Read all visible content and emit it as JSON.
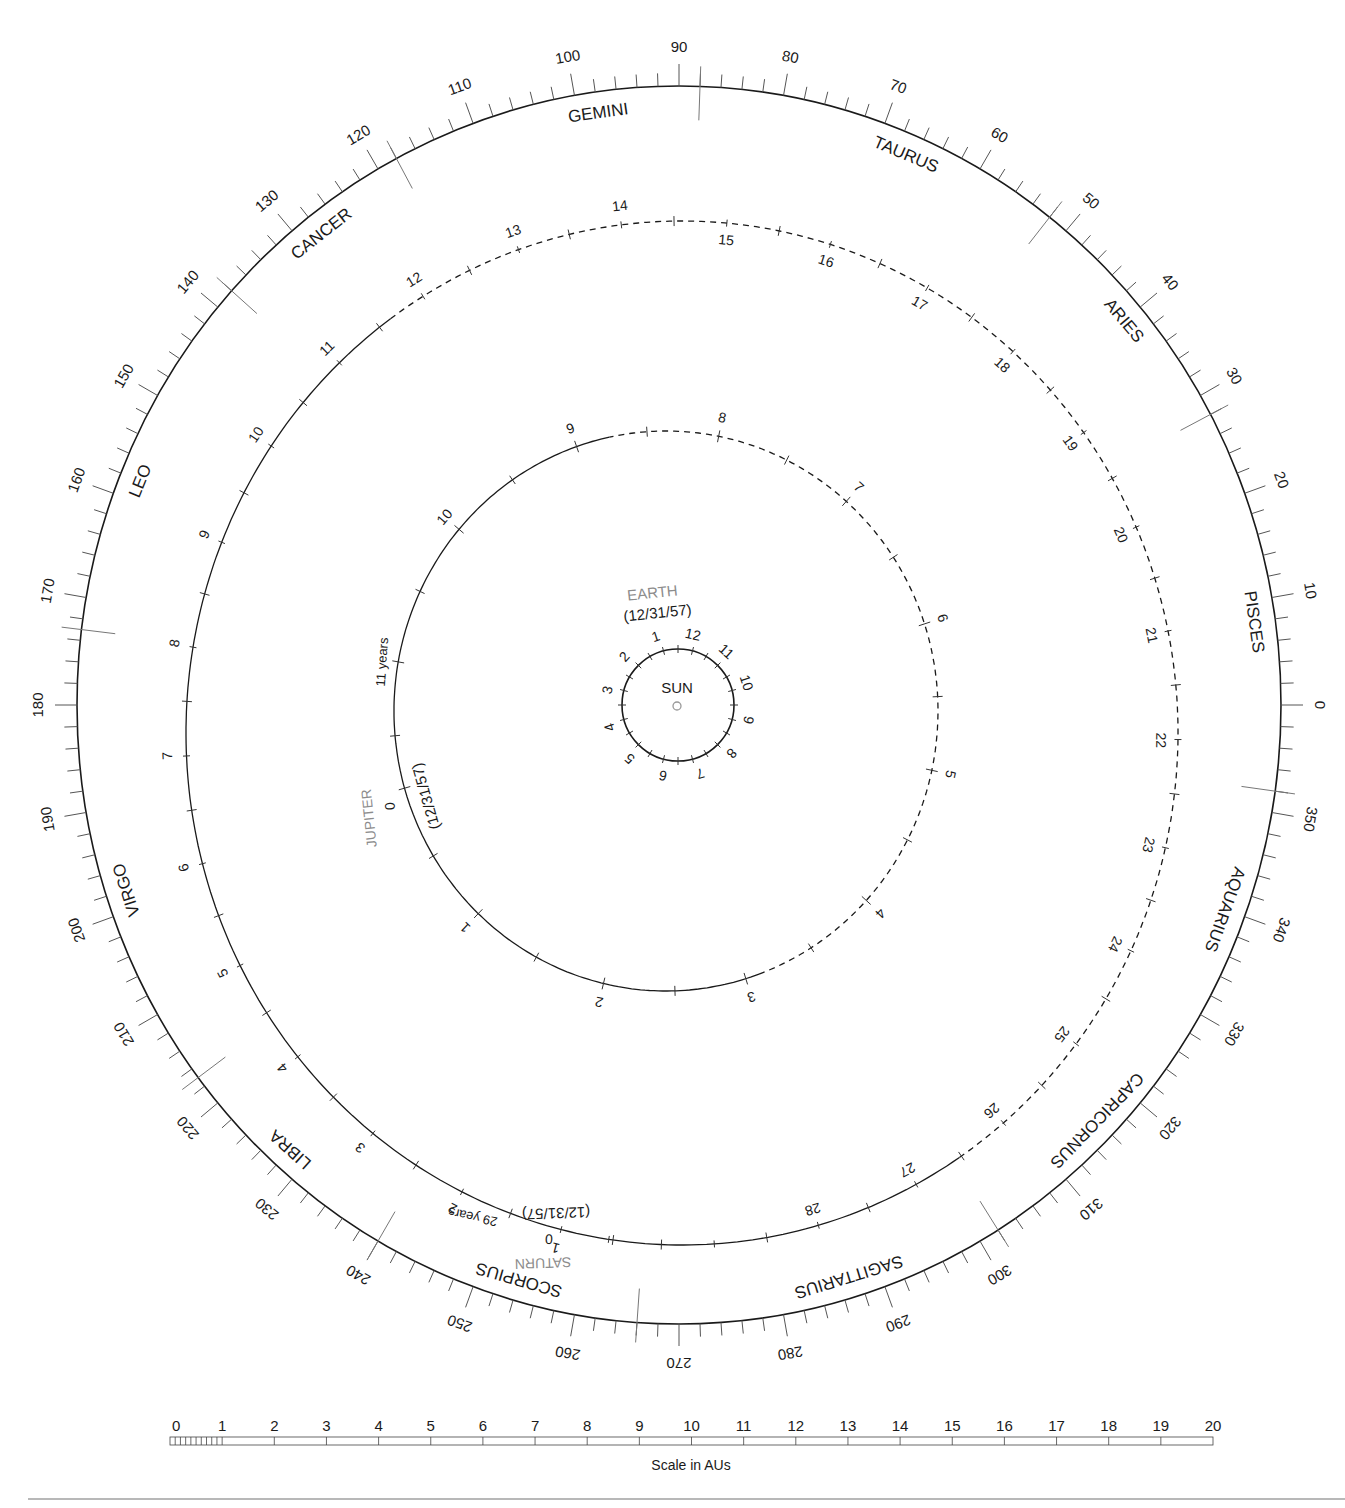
{
  "diagram": {
    "center": {
      "label": "SUN"
    },
    "ecliptic_ring": {
      "degree_labels": [
        0,
        10,
        20,
        30,
        40,
        50,
        60,
        70,
        80,
        90,
        100,
        110,
        120,
        130,
        140,
        150,
        160,
        170,
        180,
        190,
        200,
        210,
        220,
        230,
        240,
        250,
        260,
        270,
        280,
        290,
        300,
        310,
        320,
        330,
        340,
        350
      ],
      "minor_tick_step_deg": 2,
      "major_tick_step_deg": 10,
      "zodiac": [
        {
          "name": "PISCES",
          "label_deg": 8
        },
        {
          "name": "ARIES",
          "label_deg": 40
        },
        {
          "name": "TAURUS",
          "label_deg": 67
        },
        {
          "name": "GEMINI",
          "label_deg": 98
        },
        {
          "name": "CANCER",
          "label_deg": 128
        },
        {
          "name": "LEO",
          "label_deg": 158
        },
        {
          "name": "VIRGO",
          "label_deg": 198
        },
        {
          "name": "LIBRA",
          "label_deg": 228
        },
        {
          "name": "SCORPIUS",
          "label_deg": 254
        },
        {
          "name": "SAGITTARIUS",
          "label_deg": 287
        },
        {
          "name": "CAPRICORNUS",
          "label_deg": 316
        },
        {
          "name": "AQUARIUS",
          "label_deg": 340
        }
      ],
      "boundaries_deg": [
        352,
        28,
        52,
        88,
        118,
        138,
        173,
        217,
        240,
        266,
        302
      ]
    },
    "planets": [
      {
        "name": "EARTH",
        "epoch": "(12/31/57)",
        "tick_labels": [
          "12",
          "1",
          "2",
          "3",
          "4",
          "5",
          "6",
          "7",
          "8",
          "9",
          "10",
          "11"
        ],
        "unit": "months"
      },
      {
        "name": "JUPITER",
        "epoch": "(12/31/57)",
        "period_label": "11 years",
        "tick_labels": [
          "0",
          "1",
          "2",
          "3",
          "4",
          "5",
          "6",
          "7",
          "8",
          "9",
          "10",
          "11"
        ],
        "unit": "years"
      },
      {
        "name": "SATURN",
        "epoch": "(12/31/57)",
        "period_label": "29 years",
        "tick_labels": [
          "0",
          "1",
          "2",
          "3",
          "4",
          "5",
          "6",
          "7",
          "8",
          "9",
          "10",
          "11",
          "12",
          "13",
          "14",
          "15",
          "16",
          "17",
          "18",
          "19",
          "20",
          "21",
          "22",
          "23",
          "24",
          "25",
          "26",
          "27",
          "28",
          "29"
        ],
        "unit": "years"
      }
    ],
    "scale_bar": {
      "title": "Scale in AUs",
      "labels": [
        "0",
        "1",
        "2",
        "3",
        "4",
        "5",
        "6",
        "7",
        "8",
        "9",
        "10",
        "11",
        "12",
        "13",
        "14",
        "15",
        "16",
        "17",
        "18",
        "19",
        "20"
      ],
      "min": 0,
      "max": 20,
      "unit": "AU"
    }
  },
  "colors": {
    "ink": "#1a1a1a",
    "planet_label": "#8c8c8c",
    "tick": "#555555"
  }
}
